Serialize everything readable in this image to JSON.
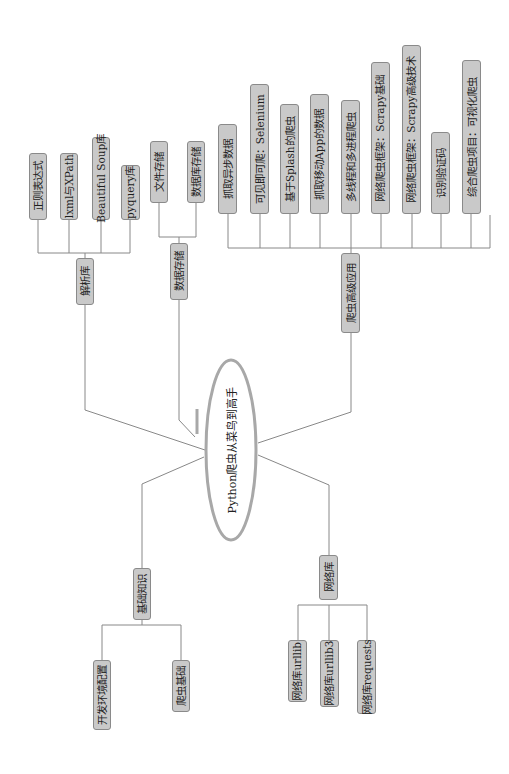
{
  "root": {
    "label": "Python爬虫从菜鸟到高手"
  },
  "branches": {
    "parsing": {
      "label": "解析库",
      "children": [
        "正则表达式",
        "lxml与XPath",
        "Beautiful Soup库",
        "pyquery库"
      ]
    },
    "storage": {
      "label": "数据存储",
      "children": [
        "文件存储",
        "数据库存储"
      ]
    },
    "advanced": {
      "label": "爬虫高级应用",
      "children": [
        "抓取异步数据",
        "可见即可爬：Selenium",
        "基于Splash的爬虫",
        "抓取移动App的数据",
        "多线程和多进程爬虫",
        "网络爬虫框架：Scrapy基础",
        "网络爬虫框架：Scrapy高级技术",
        "识别验证码",
        "综合爬虫项目：可视化爬虫"
      ]
    },
    "basics": {
      "label": "基础知识",
      "children": [
        "开发环境配置",
        "爬虫基础"
      ]
    },
    "network": {
      "label": "网络库",
      "children": [
        "网络库urllib",
        "网络库urllib3",
        "网络库requests"
      ]
    }
  },
  "colors": {
    "node_fill": "#c9c9c9",
    "node_border": "#8a8a8a",
    "line": "#888888",
    "ellipse": "#a8a8a8",
    "text": "#1e1e1e"
  }
}
